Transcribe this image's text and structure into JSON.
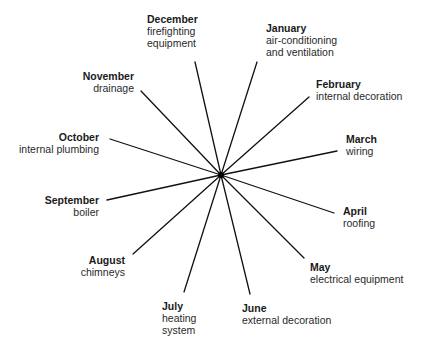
{
  "diagram": {
    "type": "radial-spoke",
    "center": {
      "x": 221,
      "y": 175
    },
    "line_color": "#111111",
    "spokes": [
      {
        "month": "January",
        "task": [
          "air-conditioning",
          "and ventilation"
        ],
        "end": {
          "x": 257,
          "y": 62
        }
      },
      {
        "month": "February",
        "task": [
          "internal decoration"
        ],
        "end": {
          "x": 309,
          "y": 97
        }
      },
      {
        "month": "March",
        "task": [
          "wiring"
        ],
        "end": {
          "x": 337,
          "y": 151
        }
      },
      {
        "month": "April",
        "task": [
          "roofing"
        ],
        "end": {
          "x": 334,
          "y": 213
        }
      },
      {
        "month": "May",
        "task": [
          "electrical equipment"
        ],
        "end": {
          "x": 304,
          "y": 258
        }
      },
      {
        "month": "June",
        "task": [
          "external decoration"
        ],
        "end": {
          "x": 250,
          "y": 294
        }
      },
      {
        "month": "July",
        "task": [
          "heating",
          "system"
        ],
        "end": {
          "x": 184,
          "y": 292
        }
      },
      {
        "month": "August",
        "task": [
          "chimneys"
        ],
        "end": {
          "x": 133,
          "y": 254
        }
      },
      {
        "month": "September",
        "task": [
          "boiler"
        ],
        "end": {
          "x": 107,
          "y": 200
        }
      },
      {
        "month": "October",
        "task": [
          "internal plumbing"
        ],
        "end": {
          "x": 110,
          "y": 139
        }
      },
      {
        "month": "November",
        "task": [
          "drainage"
        ],
        "end": {
          "x": 141,
          "y": 91
        }
      },
      {
        "month": "December",
        "task": [
          "firefighting",
          "equipment"
        ],
        "end": {
          "x": 195,
          "y": 62
        }
      }
    ]
  },
  "labels": {
    "january": {
      "month": "January",
      "line1": "air-conditioning",
      "line2": "and ventilation"
    },
    "february": {
      "month": "February",
      "line1": "internal decoration"
    },
    "march": {
      "month": "March",
      "line1": "wiring"
    },
    "april": {
      "month": "April",
      "line1": "roofing"
    },
    "may": {
      "month": "May",
      "line1": "electrical equipment"
    },
    "june": {
      "month": "June",
      "line1": "external decoration"
    },
    "july": {
      "month": "July",
      "line1": "heating",
      "line2": "system"
    },
    "august": {
      "month": "August",
      "line1": "chimneys"
    },
    "september": {
      "month": "September",
      "line1": "boiler"
    },
    "october": {
      "month": "October",
      "line1": "internal plumbing"
    },
    "november": {
      "month": "November",
      "line1": "drainage"
    },
    "december": {
      "month": "December",
      "line1": "firefighting",
      "line2": "equipment"
    }
  }
}
